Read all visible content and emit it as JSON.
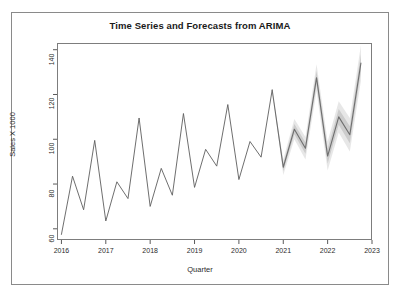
{
  "chart_data": {
    "type": "line",
    "title": "Time Series and Forecasts from ARIMA",
    "xlabel": "Quarter",
    "ylabel": "Sales X 1000",
    "xlim": [
      2015.9,
      2023.0
    ],
    "ylim": [
      55,
      143
    ],
    "xticks": [
      2016,
      2017,
      2018,
      2019,
      2020,
      2021,
      2022,
      2023
    ],
    "xtick_labels": [
      "2016",
      "2017",
      "2018",
      "2019",
      "2020",
      "2021",
      "2022",
      "2023"
    ],
    "yticks": [
      60,
      80,
      100,
      120,
      140
    ],
    "ytick_labels": [
      "60",
      "80",
      "100",
      "120",
      "140"
    ],
    "grid": false,
    "legend": "none",
    "frequency": "quarterly",
    "series": [
      {
        "name": "Observed",
        "color": "#5e5e5e",
        "x": [
          2016.0,
          2016.25,
          2016.5,
          2016.75,
          2017.0,
          2017.25,
          2017.5,
          2017.75,
          2018.0,
          2018.25,
          2018.5,
          2018.75,
          2019.0,
          2019.25,
          2019.5,
          2019.75,
          2020.0,
          2020.25,
          2020.5,
          2020.75
        ],
        "values": [
          57.5,
          83.5,
          68.5,
          99.5,
          63.5,
          81.0,
          73.5,
          109.5,
          70.0,
          87.0,
          75.0,
          111.5,
          78.5,
          95.5,
          88.0,
          115.5,
          82.0,
          99.0,
          92.0,
          122.0
        ]
      },
      {
        "name": "Forecast",
        "color": "#6e6e6e",
        "x": [
          2021.0,
          2021.25,
          2021.5,
          2021.75,
          2022.0,
          2022.25,
          2022.5,
          2022.75
        ],
        "values": [
          87.5,
          104.5,
          96.0,
          127.5,
          92.5,
          110.0,
          102.0,
          134.0
        ],
        "lower_95": [
          84.0,
          100.0,
          91.0,
          121.5,
          86.0,
          103.0,
          94.5,
          126.0
        ],
        "upper_95": [
          91.0,
          109.0,
          101.0,
          133.5,
          99.0,
          117.0,
          109.5,
          142.0
        ],
        "lower_80": [
          85.8,
          102.2,
          93.5,
          124.5,
          89.2,
          106.5,
          98.2,
          130.0
        ],
        "upper_80": [
          89.2,
          106.8,
          98.5,
          130.5,
          95.8,
          113.5,
          105.8,
          138.0
        ]
      }
    ],
    "forecast_start": 2021.0,
    "band_colors": {
      "outer_95": "#d8d8d8",
      "inner_80": "#bcbcbc"
    }
  },
  "frame": {
    "border_color": "#8a8a8a",
    "background": "#ffffff"
  }
}
